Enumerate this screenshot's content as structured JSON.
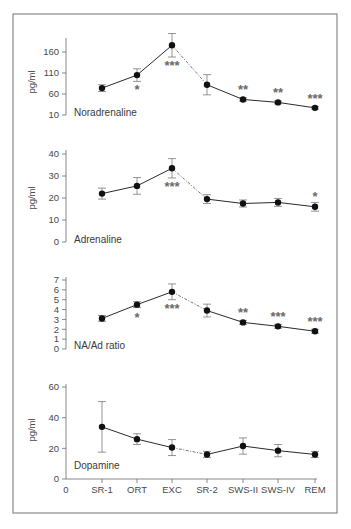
{
  "chart_data": {
    "type": "line",
    "x_categories": [
      "0",
      "SR-1",
      "ORT",
      "EXC",
      "SR-2",
      "SWS-II",
      "SWS-IV",
      "REM"
    ],
    "dashed_segment": [
      "EXC",
      "SR-2"
    ],
    "panels": [
      {
        "name": "Noradrenaline",
        "label": "Noradrenaline",
        "ylabel": "pg/ml",
        "yticks": [
          10,
          60,
          110,
          160
        ],
        "ylim": [
          10,
          195
        ],
        "categories": [
          "SR-1",
          "ORT",
          "EXC",
          "SR-2",
          "SWS-II",
          "SWS-IV",
          "REM"
        ],
        "values": [
          74,
          105,
          176,
          82,
          47,
          40,
          27
        ],
        "errors": [
          8,
          15,
          28,
          24,
          4,
          3,
          3
        ],
        "significance": [
          "",
          "*",
          "***",
          "",
          "**",
          "**",
          "***"
        ],
        "significance_position": [
          "",
          "below",
          "below",
          "",
          "above",
          "above",
          "above"
        ]
      },
      {
        "name": "Adrenaline",
        "label": "Adrenaline",
        "ylabel": "pg/ml",
        "yticks": [
          0,
          10,
          20,
          30,
          40
        ],
        "ylim": [
          0,
          42
        ],
        "categories": [
          "SR-1",
          "ORT",
          "EXC",
          "SR-2",
          "SWS-II",
          "SWS-IV",
          "REM"
        ],
        "values": [
          22,
          25.5,
          33.5,
          19.5,
          17.5,
          18,
          16
        ],
        "errors": [
          2.5,
          3.8,
          4.4,
          2,
          1.6,
          1.8,
          2
        ],
        "significance": [
          "",
          "",
          "***",
          "",
          "",
          "",
          "*"
        ],
        "significance_position": [
          "",
          "",
          "below",
          "",
          "",
          "",
          "above"
        ]
      },
      {
        "name": "NA/Ad ratio",
        "label": "NA/Ad ratio",
        "ylabel": "",
        "yticks": [
          0,
          1,
          2,
          3,
          4,
          5,
          6,
          7
        ],
        "ylim": [
          0,
          7
        ],
        "categories": [
          "SR-1",
          "ORT",
          "EXC",
          "SR-2",
          "SWS-II",
          "SWS-IV",
          "REM"
        ],
        "values": [
          3.1,
          4.5,
          5.8,
          3.9,
          2.7,
          2.3,
          1.8
        ],
        "errors": [
          0.3,
          0.3,
          0.8,
          0.65,
          0.2,
          0.2,
          0.2
        ],
        "significance": [
          "",
          "*",
          "***",
          "",
          "**",
          "***",
          "***"
        ],
        "significance_position": [
          "",
          "below",
          "below",
          "",
          "above",
          "above",
          "above"
        ]
      },
      {
        "name": "Dopamine",
        "label": "Dopamine",
        "ylabel": "pg/ml",
        "yticks": [
          0,
          20,
          40,
          60
        ],
        "ylim": [
          0,
          60
        ],
        "categories": [
          "SR-1",
          "ORT",
          "EXC",
          "SR-2",
          "SWS-II",
          "SWS-IV",
          "REM"
        ],
        "values": [
          34,
          26,
          20.5,
          16,
          21.5,
          18.5,
          16
        ],
        "errors": [
          16.5,
          3.5,
          5.2,
          2,
          5.3,
          4,
          2
        ],
        "significance": [
          "",
          "",
          "",
          "",
          "",
          "",
          ""
        ],
        "significance_position": [
          "",
          "",
          "",
          "",
          "",
          "",
          ""
        ]
      }
    ]
  }
}
